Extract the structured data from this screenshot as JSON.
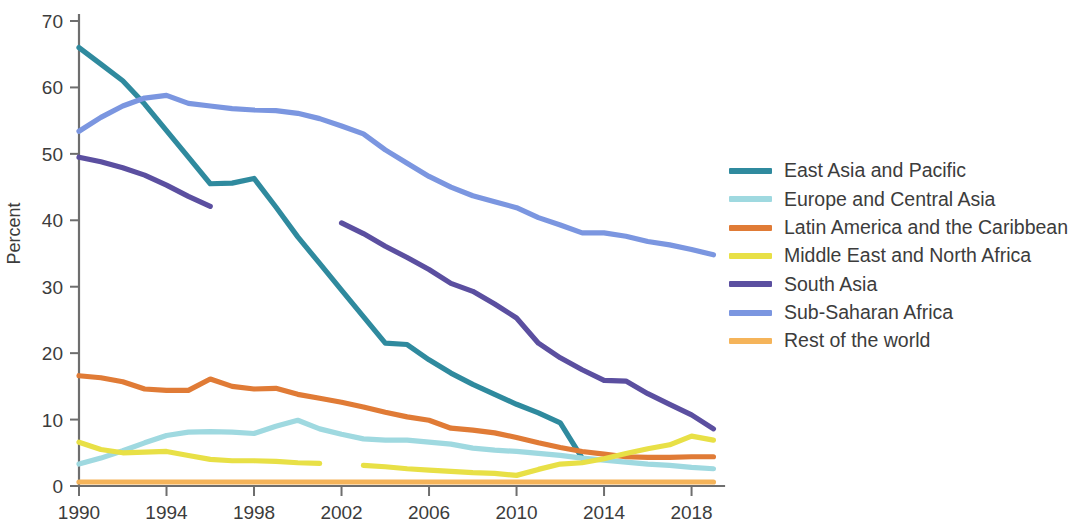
{
  "chart_data": {
    "type": "line",
    "title": "",
    "xlabel": "",
    "ylabel": "Percent",
    "xlim": [
      1990,
      2019.3
    ],
    "ylim": [
      0,
      70
    ],
    "grid": false,
    "legend_position": "right",
    "x_ticks": [
      "1990",
      "1994",
      "1998",
      "2002",
      "2006",
      "2010",
      "2014",
      "2018"
    ],
    "x_tick_values": [
      1990,
      1994,
      1998,
      2002,
      2006,
      2010,
      2014,
      2018
    ],
    "y_ticks": [
      "0",
      "10",
      "20",
      "30",
      "40",
      "50",
      "60",
      "70"
    ],
    "y_tick_values": [
      0,
      10,
      20,
      30,
      40,
      50,
      60,
      70
    ],
    "series": [
      {
        "name": "East Asia and Pacific",
        "color": "#2f8a9e",
        "x": [
          1990,
          1991,
          1992,
          1993,
          1994,
          1995,
          1996,
          1997,
          1998,
          1999,
          2000,
          2001,
          2002,
          2003,
          2004,
          2005,
          2006,
          2007,
          2008,
          2009,
          2010,
          2011,
          2012,
          2013
        ],
        "values": [
          66.0,
          63.5,
          61.0,
          57.5,
          53.5,
          49.5,
          45.5,
          45.6,
          46.3,
          42.0,
          37.5,
          33.5,
          29.5,
          25.5,
          21.5,
          21.3,
          19.0,
          17.0,
          15.3,
          13.8,
          12.3,
          11.0,
          9.5,
          4.2
        ]
      },
      {
        "name": "Europe and Central Asia",
        "color": "#9fd9e0",
        "x": [
          1990,
          1991,
          1992,
          1993,
          1994,
          1995,
          1996,
          1997,
          1998,
          1999,
          2000,
          2001,
          2002,
          2003,
          2004,
          2005,
          2006,
          2007,
          2008,
          2009,
          2010,
          2011,
          2012,
          2013,
          2014,
          2015,
          2016,
          2017,
          2018,
          2019
        ],
        "values": [
          3.3,
          4.2,
          5.3,
          6.5,
          7.6,
          8.1,
          8.2,
          8.1,
          7.9,
          9.0,
          9.9,
          8.6,
          7.8,
          7.1,
          6.9,
          6.9,
          6.6,
          6.3,
          5.7,
          5.4,
          5.2,
          4.9,
          4.6,
          4.2,
          3.9,
          3.6,
          3.3,
          3.1,
          2.8,
          2.6
        ]
      },
      {
        "name": "Latin America and the Caribbean",
        "color": "#e07b36",
        "x": [
          1990,
          1991,
          1992,
          1993,
          1994,
          1995,
          1996,
          1997,
          1998,
          1999,
          2000,
          2001,
          2002,
          2003,
          2004,
          2005,
          2006,
          2007,
          2008,
          2009,
          2010,
          2011,
          2012,
          2013,
          2014,
          2015,
          2016,
          2017,
          2018,
          2019
        ],
        "values": [
          16.6,
          16.3,
          15.7,
          14.6,
          14.4,
          14.4,
          16.1,
          15.0,
          14.6,
          14.7,
          13.8,
          13.2,
          12.6,
          11.9,
          11.1,
          10.4,
          9.9,
          8.7,
          8.4,
          8.0,
          7.3,
          6.5,
          5.8,
          5.2,
          4.8,
          4.4,
          4.3,
          4.3,
          4.4,
          4.4
        ]
      },
      {
        "name": "Middle East and North Africa",
        "color": "#e8e046",
        "segments": [
          {
            "x": [
              1990,
              1991,
              1992,
              1993,
              1994,
              1995,
              1996,
              1997,
              1998,
              1999,
              2000,
              2001
            ],
            "values": [
              6.6,
              5.5,
              5.0,
              5.1,
              5.2,
              4.6,
              4.0,
              3.8,
              3.8,
              3.7,
              3.5,
              3.4
            ]
          },
          {
            "x": [
              2003,
              2004,
              2005,
              2006,
              2007,
              2008,
              2009,
              2010,
              2011,
              2012,
              2013,
              2014,
              2015,
              2016,
              2017,
              2018,
              2019
            ],
            "values": [
              3.1,
              2.9,
              2.6,
              2.4,
              2.2,
              2.0,
              1.9,
              1.6,
              2.5,
              3.3,
              3.5,
              4.1,
              4.9,
              5.6,
              6.2,
              7.5,
              6.9
            ]
          }
        ]
      },
      {
        "name": "South Asia",
        "color": "#5b4fa0",
        "segments": [
          {
            "x": [
              1990,
              1991,
              1992,
              1993,
              1994,
              1995,
              1996
            ],
            "values": [
              49.5,
              48.8,
              47.9,
              46.8,
              45.3,
              43.6,
              42.1
            ]
          },
          {
            "x": [
              2002,
              2003,
              2004,
              2005,
              2006,
              2007,
              2008,
              2009,
              2010,
              2011,
              2012,
              2013,
              2014,
              2015,
              2016,
              2017,
              2018,
              2019
            ],
            "values": [
              39.6,
              38.0,
              36.1,
              34.4,
              32.6,
              30.5,
              29.3,
              27.4,
              25.3,
              21.5,
              19.3,
              17.5,
              15.9,
              15.8,
              13.9,
              12.3,
              10.7,
              8.6
            ]
          }
        ]
      },
      {
        "name": "Sub-Saharan Africa",
        "color": "#7b96e0",
        "x": [
          1990,
          1991,
          1992,
          1993,
          1994,
          1995,
          1996,
          1997,
          1998,
          1999,
          2000,
          2001,
          2002,
          2003,
          2004,
          2005,
          2006,
          2007,
          2008,
          2009,
          2010,
          2011,
          2012,
          2013,
          2014,
          2015,
          2016,
          2017,
          2018,
          2019
        ],
        "values": [
          53.4,
          55.5,
          57.2,
          58.4,
          58.8,
          57.6,
          57.2,
          56.8,
          56.6,
          56.5,
          56.1,
          55.3,
          54.2,
          53.0,
          50.6,
          48.6,
          46.6,
          45.0,
          43.7,
          42.8,
          41.9,
          40.4,
          39.3,
          38.1,
          38.1,
          37.6,
          36.8,
          36.3,
          35.6,
          34.8
        ]
      },
      {
        "name": "Rest of the world",
        "color": "#f5b45a",
        "x": [
          1990,
          1991,
          1992,
          1993,
          1994,
          1995,
          1996,
          1997,
          1998,
          1999,
          2000,
          2001,
          2002,
          2003,
          2004,
          2005,
          2006,
          2007,
          2008,
          2009,
          2010,
          2011,
          2012,
          2013,
          2014,
          2015,
          2016,
          2017,
          2018,
          2019
        ],
        "values": [
          0.6,
          0.6,
          0.6,
          0.6,
          0.6,
          0.6,
          0.6,
          0.6,
          0.6,
          0.6,
          0.6,
          0.6,
          0.6,
          0.6,
          0.6,
          0.6,
          0.6,
          0.6,
          0.6,
          0.6,
          0.6,
          0.6,
          0.6,
          0.6,
          0.6,
          0.6,
          0.6,
          0.6,
          0.6,
          0.6
        ]
      }
    ]
  },
  "legend": {
    "items": [
      {
        "label": "East Asia and Pacific",
        "color": "#2f8a9e"
      },
      {
        "label": "Europe and Central Asia",
        "color": "#9fd9e0"
      },
      {
        "label": "Latin America and the Caribbean",
        "color": "#e07b36"
      },
      {
        "label": "Middle East and North Africa",
        "color": "#e8e046"
      },
      {
        "label": "South Asia",
        "color": "#5b4fa0"
      },
      {
        "label": "Sub-Saharan Africa",
        "color": "#7b96e0"
      },
      {
        "label": "Rest of the world",
        "color": "#f5b45a"
      }
    ]
  }
}
